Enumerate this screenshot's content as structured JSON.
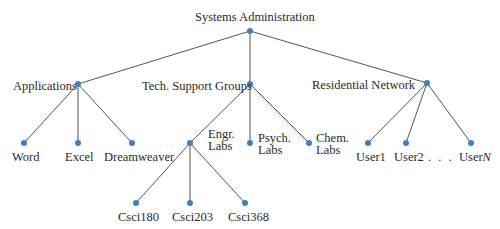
{
  "diagram": {
    "type": "tree",
    "edge_color": "#555555",
    "node_color": "#3f7fbf",
    "nodes": [
      {
        "id": "root",
        "label": "Systems Administration",
        "x": 250,
        "y": 31
      },
      {
        "id": "applications",
        "label": "Applications",
        "x": 78,
        "y": 84,
        "parent": "root"
      },
      {
        "id": "tech",
        "label": "Tech. Support Groups",
        "x": 250,
        "y": 84,
        "parent": "root"
      },
      {
        "id": "residential",
        "label": "Residential Network",
        "x": 427,
        "y": 83,
        "parent": "root"
      },
      {
        "id": "word",
        "label": "Word",
        "x": 24,
        "y": 143,
        "parent": "applications"
      },
      {
        "id": "excel",
        "label": "Excel",
        "x": 78,
        "y": 143,
        "parent": "applications"
      },
      {
        "id": "dreamweaver",
        "label": "Dreamweaver",
        "x": 132,
        "y": 143,
        "parent": "applications"
      },
      {
        "id": "engr",
        "label": "Engr. Labs",
        "x": 190,
        "y": 143,
        "parent": "tech"
      },
      {
        "id": "psych",
        "label": "Psych. Labs",
        "x": 250,
        "y": 143,
        "parent": "tech"
      },
      {
        "id": "chem",
        "label": "Chem. Labs",
        "x": 309,
        "y": 143,
        "parent": "tech"
      },
      {
        "id": "user1",
        "label": "User1",
        "x": 368,
        "y": 143,
        "parent": "residential"
      },
      {
        "id": "user2",
        "label": "User2",
        "x": 406,
        "y": 143,
        "parent": "residential"
      },
      {
        "id": "usern",
        "label": "UserN",
        "x": 471,
        "y": 143,
        "parent": "residential"
      },
      {
        "id": "csci180",
        "label": "Csci180",
        "x": 136,
        "y": 203,
        "parent": "engr"
      },
      {
        "id": "csci203",
        "label": "Csci203",
        "x": 190,
        "y": 203,
        "parent": "engr"
      },
      {
        "id": "csci368",
        "label": "Csci368",
        "x": 245,
        "y": 203,
        "parent": "engr"
      }
    ],
    "labels": {
      "root": "Systems Administration",
      "applications": "Applications",
      "tech": "Tech. Support Groups",
      "residential": "Residential Network",
      "word": "Word",
      "excel": "Excel",
      "dreamweaver": "Dreamweaver",
      "engr_1": "Engr.",
      "engr_2": "Labs",
      "psych_1": "Psych.",
      "psych_2": "Labs",
      "chem_1": "Chem.",
      "chem_2": "Labs",
      "user1": "User1",
      "user2": "User2",
      "ellipsis": ". . .",
      "usern_prefix": "User",
      "usern_var": "N",
      "csci180": "Csci180",
      "csci203": "Csci203",
      "csci368": "Csci368"
    }
  }
}
